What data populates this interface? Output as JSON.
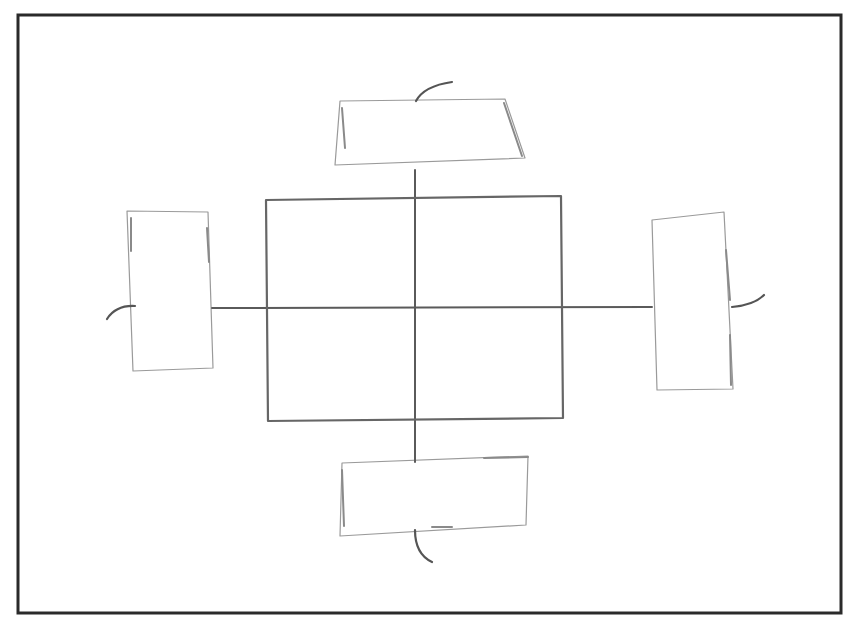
{
  "canvas": {
    "width": 854,
    "height": 618,
    "background": "#ffffff"
  },
  "colors": {
    "frame": "#2a2a2a",
    "center_rect": "#666666",
    "axis": "#5a5a5a",
    "satellite": "#9a9a9a",
    "hook": "#555555"
  },
  "diagram": {
    "frame": {
      "x": 18,
      "y": 15,
      "width": 823,
      "height": 598
    },
    "center_rect": {
      "points": [
        [
          266,
          200
        ],
        [
          561,
          196
        ],
        [
          563,
          418
        ],
        [
          268,
          421
        ]
      ]
    },
    "axes": {
      "horizontal": {
        "x1": 212,
        "y1": 308,
        "x2": 652,
        "y2": 307
      },
      "vertical": {
        "x1": 415,
        "y1": 170,
        "x2": 415,
        "y2": 462
      }
    },
    "satellites": [
      {
        "id": "top",
        "points": [
          [
            340,
            101
          ],
          [
            505,
            99
          ],
          [
            525,
            158
          ],
          [
            335,
            165
          ]
        ],
        "accents": [
          [
            [
              504,
              103
            ],
            [
              522,
              156
            ]
          ],
          [
            [
              342,
              108
            ],
            [
              345,
              148
            ]
          ]
        ],
        "hook": "M 416 101 Q 424 86 452 82"
      },
      {
        "id": "left",
        "points": [
          [
            127,
            211
          ],
          [
            208,
            212
          ],
          [
            213,
            368
          ],
          [
            133,
            371
          ]
        ],
        "accents": [
          [
            [
              131,
              218
            ],
            [
              131,
              251
            ]
          ],
          [
            [
              207,
              228
            ],
            [
              209,
              262
            ]
          ]
        ],
        "hook": "M 135 306 Q 116 305 107 319"
      },
      {
        "id": "right",
        "points": [
          [
            652,
            220
          ],
          [
            724,
            212
          ],
          [
            733,
            389
          ],
          [
            657,
            390
          ]
        ],
        "accents": [
          [
            [
              726,
              250
            ],
            [
              730,
              300
            ]
          ],
          [
            [
              730,
              335
            ],
            [
              731,
              385
            ]
          ]
        ],
        "hook": "M 732 307 Q 754 305 764 295"
      },
      {
        "id": "bottom",
        "points": [
          [
            342,
            463
          ],
          [
            528,
            456
          ],
          [
            526,
            525
          ],
          [
            340,
            536
          ]
        ],
        "accents": [
          [
            [
              484,
              458
            ],
            [
              528,
              457
            ]
          ],
          [
            [
              342,
              470
            ],
            [
              344,
              526
            ]
          ],
          [
            [
              432,
              527
            ],
            [
              452,
              527
            ]
          ]
        ],
        "hook": "M 415 530 Q 415 554 432 562"
      }
    ]
  }
}
